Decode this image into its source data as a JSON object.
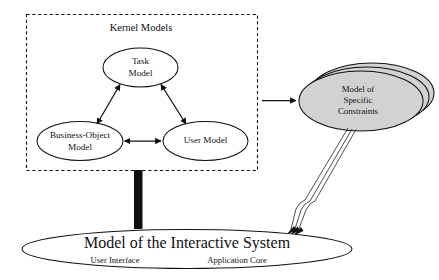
{
  "diagram": {
    "title": "Kernel Models",
    "kernel_box": {
      "label": "Kernel Models",
      "nodes": [
        {
          "id": "task",
          "line1": "Task",
          "line2": "Model"
        },
        {
          "id": "business_object",
          "line1": "Business-Object",
          "line2": "Model"
        },
        {
          "id": "user",
          "line1": "User Model",
          "line2": ""
        }
      ]
    },
    "constraints_stack": {
      "line1": "Model of",
      "line2": "Specific",
      "line3": "Constraints",
      "fill_color": "#d2d2d2",
      "stack_count": 3
    },
    "system_ellipse": {
      "title": "Model of the Interactive System",
      "left_label": "User Interface",
      "right_label": "Application Core"
    },
    "colors": {
      "stroke": "#111111",
      "gray_fill": "#d2d2d2",
      "bar": "#101010",
      "background": "#ffffff"
    }
  }
}
